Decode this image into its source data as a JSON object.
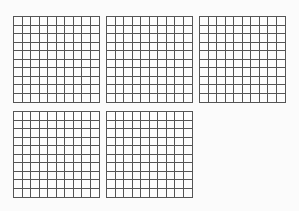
{
  "grids": [
    {
      "id": "grid-1",
      "x": 13,
      "y": 16,
      "size": 87,
      "rows": 10,
      "cols": 10
    },
    {
      "id": "grid-2",
      "x": 106,
      "y": 16,
      "size": 87,
      "rows": 10,
      "cols": 10
    },
    {
      "id": "grid-3",
      "x": 199,
      "y": 16,
      "size": 87,
      "rows": 10,
      "cols": 10
    },
    {
      "id": "grid-4",
      "x": 13,
      "y": 111,
      "size": 87,
      "rows": 10,
      "cols": 10
    },
    {
      "id": "grid-5",
      "x": 106,
      "y": 111,
      "size": 87,
      "rows": 10,
      "cols": 10
    }
  ],
  "colors": {
    "background": "#fbfbfb",
    "line": "#555555"
  }
}
